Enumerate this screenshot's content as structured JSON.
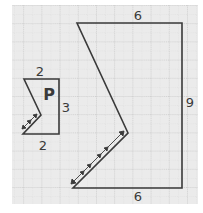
{
  "figure": {
    "shape_small": {
      "label": "P",
      "dimensions": {
        "top": "2",
        "right": "3",
        "bottom": "2"
      }
    },
    "shape_large": {
      "dimensions": {
        "top": "6",
        "right": "9",
        "bottom": "6"
      }
    }
  },
  "colors": {
    "grid_bg": "#ebebeb",
    "grid_line": "#bdbdbd",
    "stroke": "#3a3a3a",
    "text": "#3a3a3a"
  }
}
